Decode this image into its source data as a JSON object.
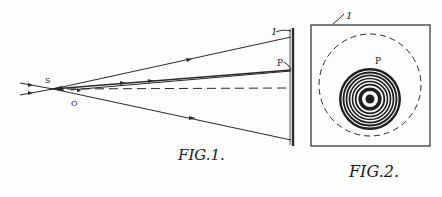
{
  "figures": [
    {
      "id": "fig1",
      "caption": "FIG.1.",
      "labels": {
        "source": "S",
        "origin": "O",
        "screen": "1",
        "point": "P"
      },
      "description": "Rays diverging from source point S through O toward screen 1; one ray strikes point P; dashed optical axis"
    },
    {
      "id": "fig2",
      "caption": "FIG.2.",
      "labels": {
        "screen": "1",
        "point": "P"
      },
      "description": "Square screen showing dashed circle and concentric interference rings with dark center"
    }
  ],
  "colors": {
    "ink": "#2a2a2a",
    "paper": "#fdfdfd"
  }
}
